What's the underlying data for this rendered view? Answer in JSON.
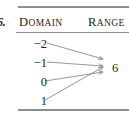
{
  "exercise": {
    "number": "6."
  },
  "headers": {
    "domain": {
      "first": "D",
      "rest": "OMAIN"
    },
    "range": {
      "first": "R",
      "rest": "ANGE"
    }
  },
  "mapping_diagram": {
    "domain_values": [
      "−2",
      "−1",
      "0",
      "1"
    ],
    "range_values": [
      "6"
    ],
    "arrows": [
      {
        "from": "−2",
        "to": "6"
      },
      {
        "from": "−1",
        "to": "6"
      },
      {
        "from": "0",
        "to": "6"
      },
      {
        "from": "1",
        "to": "6"
      }
    ]
  },
  "colors": {
    "text": "#231f20",
    "rule": "#8e8e8e",
    "arrow": "#8a8a8a"
  }
}
